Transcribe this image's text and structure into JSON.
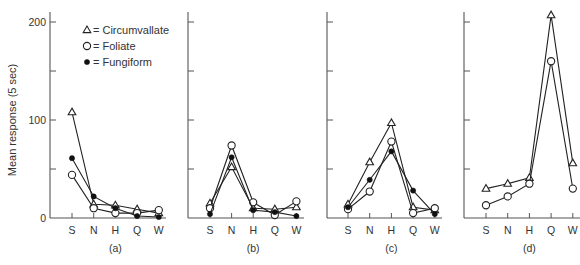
{
  "chart_data": {
    "type": "line",
    "ylabel": "Mean response (5 sec)",
    "ylim": [
      0,
      200
    ],
    "yticks": [
      0,
      50,
      100,
      150,
      200
    ],
    "ytick_labels": [
      "0",
      "",
      "100",
      "",
      "200"
    ],
    "categories": [
      "S",
      "N",
      "H",
      "Q",
      "W"
    ],
    "legend": [
      {
        "symbol": "triangle-open",
        "label": "Circumvallate"
      },
      {
        "symbol": "circle-open",
        "label": "Foliate"
      },
      {
        "symbol": "circle-filled",
        "label": "Fungiform"
      }
    ],
    "legend_text": [
      "△ = Circumvallate",
      "○ = Foliate",
      "● = Fungiform"
    ],
    "panels": [
      {
        "caption": "(a)",
        "series": [
          {
            "name": "Circumvallate",
            "values": [
              108,
              14,
              13,
              9,
              5
            ]
          },
          {
            "name": "Foliate",
            "values": [
              44,
              10,
              5,
              5,
              8
            ]
          },
          {
            "name": "Fungiform",
            "values": [
              61,
              22,
              10,
              2,
              1
            ]
          }
        ]
      },
      {
        "caption": "(b)",
        "series": [
          {
            "name": "Circumvallate",
            "values": [
              15,
              52,
              10,
              9,
              11
            ]
          },
          {
            "name": "Foliate",
            "values": [
              10,
              74,
              16,
              3,
              17
            ]
          },
          {
            "name": "Fungiform",
            "values": [
              4,
              62,
              8,
              6,
              2
            ]
          }
        ]
      },
      {
        "caption": "(c)",
        "series": [
          {
            "name": "Circumvallate",
            "values": [
              14,
              57,
              97,
              11,
              8
            ]
          },
          {
            "name": "Foliate",
            "values": [
              9,
              27,
              78,
              5,
              10
            ]
          },
          {
            "name": "Fungiform",
            "values": [
              11,
              39,
              68,
              28,
              4
            ]
          }
        ]
      },
      {
        "caption": "(d)",
        "series": [
          {
            "name": "Circumvallate",
            "values": [
              30,
              35,
              41,
              207,
              56
            ]
          },
          {
            "name": "Foliate",
            "values": [
              13,
              22,
              35,
              160,
              30
            ]
          }
        ]
      }
    ]
  }
}
